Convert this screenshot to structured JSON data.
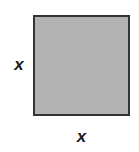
{
  "figure": {
    "type": "geometry-diagram",
    "shape_name": "square",
    "canvas": {
      "width": 139,
      "height": 152,
      "background_color": "#ffffff"
    },
    "shape": {
      "fill_color": "#b2b2b2",
      "stroke_color": "#333333",
      "stroke_width": 2,
      "x": 33,
      "y": 15,
      "width": 97,
      "height": 101
    },
    "labels": {
      "left_side": "x",
      "bottom_side": "x"
    }
  }
}
